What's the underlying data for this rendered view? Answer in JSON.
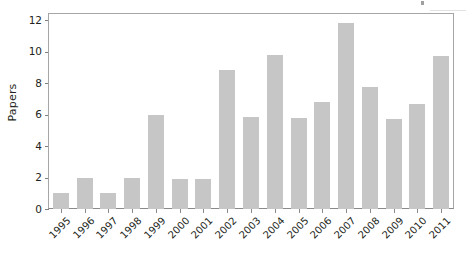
{
  "chart_data": {
    "type": "bar",
    "title": "",
    "subtitle": "",
    "xlabel": "",
    "ylabel": "Papers",
    "categories": [
      "1995",
      "1996",
      "1997",
      "1998",
      "1999",
      "2000",
      "2001",
      "2002",
      "2003",
      "2004",
      "2005",
      "2006",
      "2007",
      "2008",
      "2009",
      "2010",
      "2011"
    ],
    "values": [
      1.0,
      2.0,
      1.0,
      2.0,
      5.95,
      1.9,
      1.9,
      8.85,
      5.85,
      9.8,
      5.8,
      6.8,
      11.8,
      7.75,
      5.75,
      6.7,
      9.7
    ],
    "series": [
      {
        "name": "Papers",
        "values": [
          1.0,
          2.0,
          1.0,
          2.0,
          5.95,
          1.9,
          1.9,
          8.85,
          5.85,
          9.8,
          5.8,
          6.8,
          11.8,
          7.75,
          5.75,
          6.7,
          9.7
        ]
      }
    ],
    "ylim": [
      0,
      12.4
    ],
    "yticks": [
      0,
      2,
      4,
      6,
      8,
      10,
      12
    ],
    "ytick_labels": [
      "0",
      "2",
      "4",
      "6",
      "8",
      "10",
      "12"
    ],
    "grid": false,
    "legend": null,
    "legend_position": "none",
    "bar_color": "#c6c6c6",
    "axis_color": "#8a8a8a",
    "frame_color": "#a6a6a6",
    "text_color": "#231f20",
    "background": "#ffffff",
    "xtick_rotation": -45,
    "annotations": []
  },
  "figure": {
    "artifact_tick_name": "scan-artifact-tick",
    "artifact_smudge_name": "scan-artifact-smudge"
  }
}
